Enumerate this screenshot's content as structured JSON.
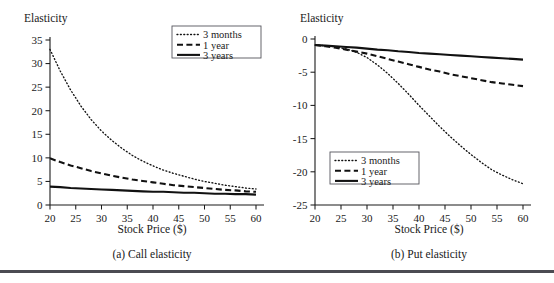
{
  "figure": {
    "name": "option-elasticity-figure",
    "bottom_rule_color": "#4b4b52"
  },
  "panels": [
    {
      "id": "call",
      "caption": "(a) Call elasticity",
      "y_axis_title": "Elasticity",
      "x_axis_title": "Stock Price ($)",
      "y_ticks": [
        0,
        5,
        10,
        15,
        20,
        25,
        30,
        35
      ],
      "x_ticks": [
        20,
        25,
        30,
        35,
        40,
        45,
        50,
        55,
        60
      ],
      "legend_position": "top-right",
      "legend": [
        {
          "label": "3 months",
          "style": "dotted"
        },
        {
          "label": "1 year",
          "style": "dashed"
        },
        {
          "label": "3 years",
          "style": "solid"
        }
      ]
    },
    {
      "id": "put",
      "caption": "(b) Put elasticity",
      "y_axis_title": "Elasticity",
      "x_axis_title": "Stock Price ($)",
      "y_ticks": [
        0,
        -5,
        -10,
        -15,
        -20,
        -25
      ],
      "x_ticks": [
        20,
        25,
        30,
        35,
        40,
        45,
        50,
        55,
        60
      ],
      "legend_position": "bottom-left",
      "legend": [
        {
          "label": "3 months",
          "style": "dotted"
        },
        {
          "label": "1 year",
          "style": "dashed"
        },
        {
          "label": "3 years",
          "style": "solid"
        }
      ]
    }
  ],
  "chart_data": [
    {
      "type": "line",
      "id": "call-elasticity",
      "title": "(a) Call elasticity",
      "xlabel": "Stock Price ($)",
      "ylabel": "Elasticity",
      "xlim": [
        20,
        60
      ],
      "ylim": [
        0,
        35
      ],
      "xticks": [
        20,
        25,
        30,
        35,
        40,
        45,
        50,
        55,
        60
      ],
      "yticks": [
        0,
        5,
        10,
        15,
        20,
        25,
        30,
        35
      ],
      "grid": false,
      "legend_position": "top-right",
      "x": [
        20,
        22,
        24,
        26,
        28,
        30,
        32,
        34,
        36,
        38,
        40,
        42,
        44,
        46,
        48,
        50,
        52,
        54,
        56,
        58,
        60
      ],
      "series": [
        {
          "name": "3 months",
          "style": "dotted",
          "values": [
            33.0,
            28.4,
            24.4,
            21.0,
            18.1,
            15.7,
            13.7,
            12.0,
            10.5,
            9.3,
            8.3,
            7.4,
            6.7,
            6.1,
            5.5,
            5.0,
            4.6,
            4.2,
            3.9,
            3.6,
            3.4
          ]
        },
        {
          "name": "1 year",
          "style": "dashed",
          "values": [
            9.9,
            9.1,
            8.4,
            7.8,
            7.2,
            6.7,
            6.2,
            5.8,
            5.4,
            5.1,
            4.8,
            4.5,
            4.2,
            4.0,
            3.8,
            3.6,
            3.4,
            3.2,
            3.1,
            2.9,
            2.8
          ]
        },
        {
          "name": "3 years",
          "style": "solid",
          "values": [
            3.9,
            3.8,
            3.6,
            3.5,
            3.4,
            3.3,
            3.2,
            3.1,
            3.0,
            2.9,
            2.8,
            2.8,
            2.7,
            2.6,
            2.6,
            2.5,
            2.4,
            2.4,
            2.3,
            2.3,
            2.2
          ]
        }
      ]
    },
    {
      "type": "line",
      "id": "put-elasticity",
      "title": "(b) Put elasticity",
      "xlabel": "Stock Price ($)",
      "ylabel": "Elasticity",
      "xlim": [
        20,
        60
      ],
      "ylim": [
        -25,
        0
      ],
      "xticks": [
        20,
        25,
        30,
        35,
        40,
        45,
        50,
        55,
        60
      ],
      "yticks": [
        0,
        -5,
        -10,
        -15,
        -20,
        -25
      ],
      "grid": false,
      "legend_position": "bottom-left",
      "x": [
        20,
        22,
        24,
        26,
        28,
        30,
        32,
        34,
        36,
        38,
        40,
        42,
        44,
        46,
        48,
        50,
        52,
        54,
        56,
        58,
        60
      ],
      "series": [
        {
          "name": "3 months",
          "style": "dotted",
          "values": [
            -0.9,
            -1.0,
            -1.2,
            -1.5,
            -2.0,
            -2.8,
            -3.9,
            -5.2,
            -6.7,
            -8.3,
            -10.0,
            -11.6,
            -13.2,
            -14.7,
            -16.1,
            -17.4,
            -18.6,
            -19.7,
            -20.5,
            -21.2,
            -21.8
          ]
        },
        {
          "name": "1 year",
          "style": "dashed",
          "values": [
            -0.9,
            -1.1,
            -1.3,
            -1.6,
            -1.9,
            -2.2,
            -2.6,
            -3.0,
            -3.4,
            -3.8,
            -4.2,
            -4.6,
            -4.9,
            -5.3,
            -5.6,
            -5.9,
            -6.2,
            -6.5,
            -6.7,
            -6.9,
            -7.1
          ]
        },
        {
          "name": "3 years",
          "style": "solid",
          "values": [
            -0.9,
            -1.0,
            -1.1,
            -1.2,
            -1.3,
            -1.45,
            -1.6,
            -1.7,
            -1.85,
            -1.95,
            -2.1,
            -2.2,
            -2.3,
            -2.4,
            -2.5,
            -2.6,
            -2.7,
            -2.8,
            -2.9,
            -3.0,
            -3.1
          ]
        }
      ]
    }
  ]
}
